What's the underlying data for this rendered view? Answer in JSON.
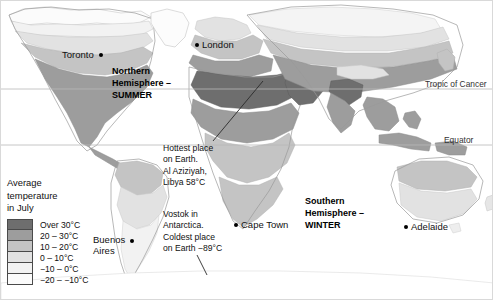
{
  "map": {
    "title": "World average temperature in July",
    "projection": "world",
    "background_color": "#ffffff",
    "border_color": "#d9d9d9"
  },
  "legend": {
    "title_lines": [
      "Average",
      "temperature",
      "in July"
    ],
    "items": [
      {
        "label": "Over 30°C",
        "color": "#6e6e6e"
      },
      {
        "label": "20 – 30°C",
        "color": "#9d9d9d"
      },
      {
        "label": "10 – 20°C",
        "color": "#c4c4c4"
      },
      {
        "label": "0 – 10°C",
        "color": "#e2e2e2"
      },
      {
        "label": "−10 – 0°C",
        "color": "#f2f2f2"
      },
      {
        "label": "−20 – −10°C",
        "color": "#fbfbfb"
      }
    ]
  },
  "latitude_lines": [
    {
      "name": "Tropic of Cancer",
      "label": "Tropic of Cancer"
    },
    {
      "name": "Equator",
      "label": "Equator"
    }
  ],
  "places": [
    {
      "name": "Toronto",
      "label": "Toronto",
      "dot_side": "right"
    },
    {
      "name": "London",
      "label": "London",
      "dot_side": "left"
    },
    {
      "name": "Buenos Aires",
      "label_line1": "Buenos",
      "label_line2": "Aires",
      "dot_side": "right"
    },
    {
      "name": "Cape Town",
      "label": "Cape Town",
      "dot_side": "left"
    },
    {
      "name": "Adelaide",
      "label": "Adelaide",
      "dot_side": "left"
    }
  ],
  "season_labels": [
    {
      "name": "northern-summer",
      "lines": [
        "Northern",
        "Hemisphere –",
        "SUMMER"
      ]
    },
    {
      "name": "southern-winter",
      "lines": [
        "Southern",
        "Hemisphere –",
        "WINTER"
      ]
    }
  ],
  "annotations": [
    {
      "name": "hottest-place",
      "lines": [
        "Hottest place",
        "on Earth.",
        "Al Aziziyah,",
        "Libya 58°C"
      ],
      "has_leader_line": true
    },
    {
      "name": "coldest-place",
      "lines": [
        "Vostok in",
        "Antarctica.",
        "Coldest place",
        "on Earth −89°C"
      ],
      "has_leader_line": true
    }
  ]
}
